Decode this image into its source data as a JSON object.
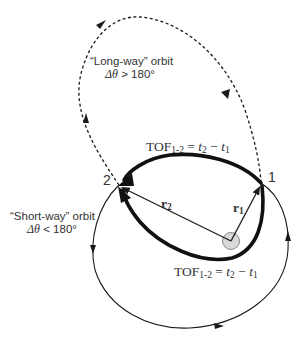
{
  "diagram": {
    "long_way": {
      "label": "“Long-way” orbit",
      "condition_symbol": "Δθ",
      "condition": " > 180°"
    },
    "short_way": {
      "label": "“Short-way” orbit",
      "condition_symbol": "Δθ",
      "condition": " < 180°"
    },
    "tof_top": {
      "prefix": "TOF",
      "sub": "1-2",
      "eq": " = ",
      "t2": "t",
      "t2_sub": "2",
      "minus": " − ",
      "t1": "t",
      "t1_sub": "1"
    },
    "tof_bottom": {
      "prefix": "TOF",
      "sub": "1-2",
      "eq": " = ",
      "t2": "t",
      "t2_sub": "2",
      "minus": " − ",
      "t1": "t",
      "t1_sub": "1"
    },
    "point_1": "1",
    "point_2": "2",
    "r1": {
      "symbol": "r",
      "sub": "1"
    },
    "r2": {
      "symbol": "r",
      "sub": "2"
    },
    "colors": {
      "line": "#1a1a1a",
      "text": "#333333",
      "focus_fill": "#d9d9d9",
      "focus_stroke": "#8a8a8a"
    }
  }
}
